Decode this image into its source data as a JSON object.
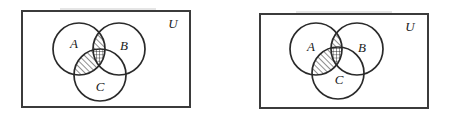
{
  "figure": {
    "background_color": "#ffffff",
    "ink_color": "#2a2a2a",
    "hatch_color": "#1f1f1f",
    "panel_count": 2
  },
  "panels": [
    {
      "id": "left-panel",
      "universe_label": "U",
      "rect": {
        "x": 22,
        "y": 11,
        "w": 168,
        "h": 96
      },
      "universe_label_pos": {
        "x": 173,
        "y": 25
      },
      "circles": [
        {
          "label": "A",
          "cx": 79,
          "cy": 49,
          "r": 26,
          "label_x": 74,
          "label_y": 45
        },
        {
          "label": "B",
          "cx": 119,
          "cy": 49,
          "r": 26,
          "label_x": 124,
          "label_y": 47
        },
        {
          "label": "C",
          "cx": 100,
          "cy": 75,
          "r": 26,
          "label_x": 100,
          "label_y": 88
        }
      ],
      "shaded_regions": [
        {
          "name": "A-intersect-B-not-C",
          "pattern": "diagonal"
        },
        {
          "name": "A-intersect-C-not-B",
          "pattern": "diagonal"
        },
        {
          "name": "A-intersect-B-intersect-C",
          "pattern": "crosshatch"
        }
      ]
    },
    {
      "id": "right-panel",
      "universe_label": "U",
      "rect": {
        "x": 260,
        "y": 14,
        "w": 168,
        "h": 94
      },
      "universe_label_pos": {
        "x": 410,
        "y": 28
      },
      "circles": [
        {
          "label": "A",
          "cx": 316,
          "cy": 49,
          "r": 26,
          "label_x": 311,
          "label_y": 48
        },
        {
          "label": "B",
          "cx": 357,
          "cy": 49,
          "r": 26,
          "label_x": 362,
          "label_y": 49
        },
        {
          "label": "C",
          "cx": 338,
          "cy": 73,
          "r": 26,
          "label_x": 339,
          "label_y": 81
        }
      ],
      "shaded_regions": [
        {
          "name": "A-intersect-B-not-C",
          "pattern": "diagonal"
        },
        {
          "name": "A-intersect-C-not-B",
          "pattern": "diagonal"
        },
        {
          "name": "A-intersect-B-intersect-C",
          "pattern": "crosshatch"
        }
      ]
    }
  ]
}
